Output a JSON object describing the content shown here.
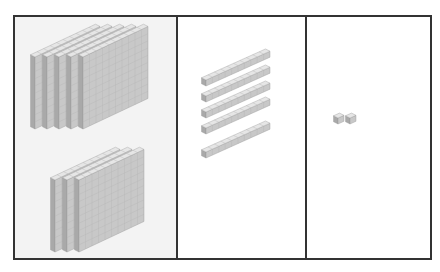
{
  "diagram": {
    "type": "base-ten-blocks",
    "represented_value": 852,
    "panels": [
      {
        "name": "hundreds",
        "block": "flat",
        "count": 8,
        "groups": [
          5,
          3
        ]
      },
      {
        "name": "tens",
        "block": "rod",
        "count": 5
      },
      {
        "name": "ones",
        "block": "unit-cube",
        "count": 2
      }
    ],
    "colors": {
      "border": "#333333",
      "hundreds_panel_bg": "#f3f3f3",
      "face_front": "#c8c8c8",
      "face_side": "#a9a9a9",
      "face_top": "#e6e6e6",
      "grid_line": "#b5b5b5"
    }
  }
}
